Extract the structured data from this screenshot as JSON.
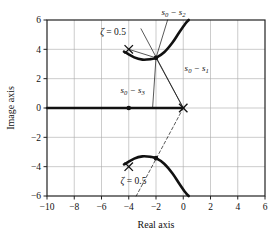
{
  "chart_data": {
    "type": "line",
    "title": "",
    "xlabel": "Real axis",
    "ylabel": "Image axis",
    "xlim": [
      -10,
      6
    ],
    "ylim": [
      -6,
      6
    ],
    "xticks": [
      -10,
      -8,
      -6,
      -4,
      -2,
      0,
      2,
      4,
      6
    ],
    "xtick_labels": [
      "−10",
      "−8",
      "−6",
      "−4",
      "−2",
      "0",
      "2",
      "4",
      "6"
    ],
    "yticks": [
      -6,
      -4,
      -2,
      0,
      2,
      4,
      6
    ],
    "ytick_labels": [
      "−6",
      "−4",
      "−2",
      "0",
      "2",
      "4",
      "6"
    ],
    "grid": true,
    "legend": "none",
    "series": [
      {
        "name": "root-locus-real-axis-branch",
        "style": "thick-solid",
        "points": [
          [
            -10,
            0
          ],
          [
            0,
            0
          ]
        ]
      },
      {
        "name": "root-locus-upper-branch",
        "style": "thick-solid",
        "points": [
          [
            -4.35,
            3.85
          ],
          [
            -3.6,
            3.45
          ],
          [
            -3.0,
            3.3
          ],
          [
            -2.4,
            3.33
          ],
          [
            -2.0,
            3.42
          ],
          [
            -1.4,
            3.8
          ],
          [
            -0.8,
            4.45
          ],
          [
            -0.3,
            5.15
          ],
          [
            0.15,
            5.75
          ],
          [
            0.4,
            6.0
          ]
        ]
      },
      {
        "name": "root-locus-lower-branch",
        "style": "thick-solid",
        "points": [
          [
            -4.35,
            -3.85
          ],
          [
            -3.6,
            -3.45
          ],
          [
            -3.0,
            -3.3
          ],
          [
            -2.4,
            -3.33
          ],
          [
            -2.0,
            -3.42
          ],
          [
            -1.4,
            -3.8
          ],
          [
            -0.8,
            -4.45
          ],
          [
            -0.3,
            -5.15
          ],
          [
            0.15,
            -5.75
          ],
          [
            0.4,
            -6.0
          ]
        ]
      },
      {
        "name": "zeta-line-upper",
        "style": "thin-solid",
        "points": [
          [
            0,
            0
          ],
          [
            -3.1,
            5.4
          ]
        ]
      },
      {
        "name": "zeta-line-lower-dashed",
        "style": "thin-dashed",
        "points": [
          [
            0,
            0
          ],
          [
            -3.45,
            -6.0
          ]
        ]
      },
      {
        "name": "vector-s0-s1",
        "style": "thin-solid",
        "points": [
          [
            -2.0,
            3.42
          ],
          [
            0,
            0
          ]
        ]
      },
      {
        "name": "vector-s0-s2",
        "style": "thin-solid",
        "points": [
          [
            -2.0,
            3.42
          ],
          [
            -1.15,
            6.0
          ]
        ]
      },
      {
        "name": "vector-s0-s3",
        "style": "thin-solid",
        "points": [
          [
            -2.0,
            3.42
          ],
          [
            -4.0,
            4.0
          ]
        ]
      },
      {
        "name": "vector-s0-down",
        "style": "thin-solid",
        "points": [
          [
            -2.0,
            3.42
          ],
          [
            -2.25,
            0.0
          ]
        ]
      }
    ],
    "markers": [
      {
        "name": "pole-x-upper",
        "symbol": "x",
        "x": -4.0,
        "y": 4.0
      },
      {
        "name": "pole-x-lower",
        "symbol": "x",
        "x": -4.0,
        "y": -4.0
      },
      {
        "name": "pole-x-origin",
        "symbol": "x",
        "x": 0.0,
        "y": 0.0
      },
      {
        "name": "test-point-dot-upper",
        "symbol": "dot",
        "x": -2.0,
        "y": 3.42
      },
      {
        "name": "test-point-dot-lower",
        "symbol": "dot",
        "x": -2.0,
        "y": -3.42
      },
      {
        "name": "test-point-dot-real",
        "symbol": "dot",
        "x": -4.0,
        "y": 0.0
      }
    ],
    "annotations": [
      {
        "name": "label-s0-s2",
        "text": "s₀ − s₂",
        "base": "s",
        "sub": "0",
        "sub2": "2",
        "x": -1.6,
        "y": 6.35
      },
      {
        "name": "label-s0-s1",
        "text": "s₀ − s₁",
        "base": "s",
        "sub": "0",
        "sub2": "1",
        "x": 0.1,
        "y": 2.55
      },
      {
        "name": "label-s0-s3",
        "text": "s₀ − s₃",
        "base": "s",
        "sub": "0",
        "sub2": "3",
        "x": -4.6,
        "y": 1.05
      },
      {
        "name": "label-zeta-upper",
        "text": "ζ = 0.5",
        "x": -6.1,
        "y": 4.95
      },
      {
        "name": "label-zeta-lower",
        "text": "ζ = 0.5",
        "x": -4.6,
        "y": -5.15
      }
    ]
  },
  "labels": {
    "x_axis_title": "Real axis",
    "y_axis_title": "Image axis",
    "zeta_upper": "ζ = 0.5",
    "zeta_lower": "ζ = 0.5",
    "s0_s1_main": "s",
    "s0_s1_sub_a": "0",
    "s0_s1_minus": " − ",
    "s0_s1_sub_b": "1",
    "s0_s2_sub_b": "2",
    "s0_s3_sub_b": "3",
    "zeta_symbol": "ζ",
    "zeta_value": " = 0.5"
  },
  "colors": {
    "ink": "#111111",
    "grid": "#aaaaaa",
    "frame": "#222222",
    "background": "#ffffff"
  }
}
